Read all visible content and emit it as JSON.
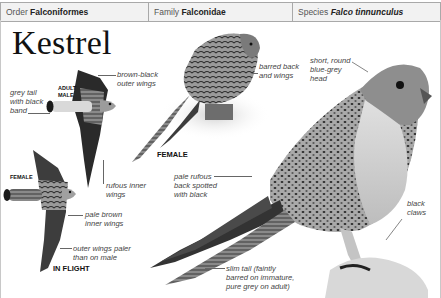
{
  "header": {
    "order": {
      "label": "Order",
      "value": "Falconiformes"
    },
    "family": {
      "label": "Family",
      "value": "Falconidae"
    },
    "species": {
      "label": "Species",
      "value": "Falco tinnunculus"
    }
  },
  "title": "Kestrel",
  "figures": {
    "adult_male_flight": {
      "caption": "ADULT MALE",
      "labels": [
        "grey tail with black band",
        "brown-black outer wings",
        "rufous inner wings"
      ]
    },
    "female_flight": {
      "caption": "FEMALE",
      "labels": [
        "pale brown inner wings",
        "outer wings paler than on male"
      ]
    },
    "flight_caption": "IN FLIGHT",
    "female_perched": {
      "caption": "FEMALE",
      "labels": [
        "barred back and wings"
      ]
    },
    "male_perched": {
      "labels": [
        "short, round blue-grey head",
        "pale rufous back spotted with black",
        "black claws",
        "slim tail (faintly barred on immature, pure grey on adult)"
      ]
    }
  },
  "text": {
    "grey_tail_1": "grey tail",
    "grey_tail_2": "with black",
    "grey_tail_3": "band",
    "adult": "ADULT",
    "male": "MALE",
    "brown_black_1": "brown-black",
    "brown_black_2": "outer wings",
    "rufous_inner_1": "rufous inner",
    "rufous_inner_2": "wings",
    "female_flight": "FEMALE",
    "pale_brown_1": "pale brown",
    "pale_brown_2": "inner wings",
    "outer_paler_1": "outer wings paler",
    "outer_paler_2": "than on male",
    "in_flight": "IN FLIGHT",
    "barred_1": "barred back",
    "barred_2": "and wings",
    "female_perched": "FEMALE",
    "head_1": "short, round",
    "head_2": "blue-grey",
    "head_3": "head",
    "rufous_back_1": "pale rufous",
    "rufous_back_2": "back spotted",
    "rufous_back_3": "with black",
    "claws_1": "black",
    "claws_2": "claws",
    "tail_1": "slim tail (faintly",
    "tail_2": "barred on immature,",
    "tail_3": "pure grey on adult)"
  }
}
